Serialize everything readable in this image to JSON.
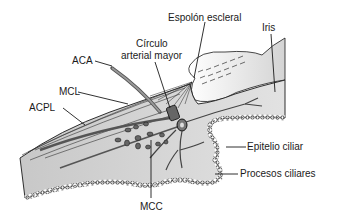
{
  "figure": {
    "type": "anatomical-diagram"
  },
  "labels": {
    "espolon": "Espolón escleral",
    "iris": "Iris",
    "circulo_1": "Círculo",
    "circulo_2": "arterial mayor",
    "aca": "ACA",
    "mcl": "MCL",
    "acpl": "ACPL",
    "epitelio": "Epitelio ciliar",
    "procesos": "Procesos ciliares",
    "mcc": "MCC"
  },
  "colors": {
    "tissue": "#d9d9d9",
    "tissue_dark": "#bdbdbd",
    "outline": "#1a1a1a",
    "background": "#ffffff"
  }
}
